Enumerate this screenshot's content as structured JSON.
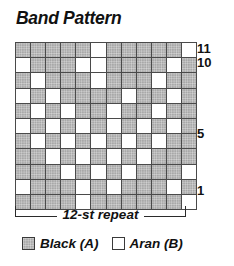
{
  "title": "Band Pattern",
  "chart_data": {
    "type": "heatmap",
    "title": "Band Pattern",
    "xlabel": "12-st repeat",
    "ylabel": "",
    "columns": 12,
    "rows": 11,
    "categories": [
      "1",
      "2",
      "3",
      "4",
      "5",
      "6",
      "7",
      "8",
      "9",
      "10",
      "11",
      "12"
    ],
    "row_labels_visible": [
      "11",
      "10",
      "5",
      "1"
    ],
    "row_label_positions": [
      11,
      10,
      5,
      1
    ],
    "legend": [
      {
        "key": "black",
        "label": "Black (A)",
        "color": "#a8a8a8",
        "symbol": "shaded"
      },
      {
        "key": "aran",
        "label": "Aran (B)",
        "color": "#ffffff",
        "symbol": "empty"
      }
    ],
    "legend_position": "bottom",
    "grid": true,
    "cell_values_legend": {
      "0": "black",
      "1": "aran"
    },
    "grid_rows_top_to_bottom": [
      {
        "row": 11,
        "cells": [
          0,
          0,
          0,
          0,
          0,
          1,
          0,
          0,
          0,
          0,
          0,
          1
        ]
      },
      {
        "row": 10,
        "cells": [
          1,
          0,
          0,
          0,
          1,
          1,
          0,
          0,
          0,
          0,
          1,
          0
        ]
      },
      {
        "row": 9,
        "cells": [
          0,
          1,
          0,
          0,
          0,
          1,
          0,
          0,
          0,
          1,
          0,
          0
        ]
      },
      {
        "row": 8,
        "cells": [
          1,
          0,
          1,
          0,
          0,
          0,
          0,
          1,
          0,
          0,
          1,
          0
        ]
      },
      {
        "row": 7,
        "cells": [
          0,
          1,
          0,
          1,
          0,
          0,
          1,
          0,
          0,
          1,
          0,
          0
        ]
      },
      {
        "row": 6,
        "cells": [
          1,
          0,
          1,
          0,
          1,
          0,
          1,
          0,
          1,
          0,
          1,
          0
        ]
      },
      {
        "row": 5,
        "cells": [
          0,
          1,
          0,
          1,
          0,
          1,
          0,
          1,
          0,
          1,
          0,
          0
        ]
      },
      {
        "row": 4,
        "cells": [
          0,
          0,
          1,
          0,
          1,
          0,
          1,
          0,
          1,
          0,
          0,
          0
        ]
      },
      {
        "row": 3,
        "cells": [
          0,
          0,
          0,
          1,
          0,
          1,
          0,
          1,
          0,
          0,
          0,
          1
        ]
      },
      {
        "row": 2,
        "cells": [
          1,
          0,
          0,
          0,
          1,
          0,
          1,
          0,
          0,
          0,
          1,
          0
        ]
      },
      {
        "row": 1,
        "cells": [
          0,
          0,
          0,
          0,
          1,
          0,
          0,
          0,
          0,
          0,
          0,
          1
        ]
      }
    ]
  },
  "repeat": {
    "label": "12-st repeat"
  }
}
